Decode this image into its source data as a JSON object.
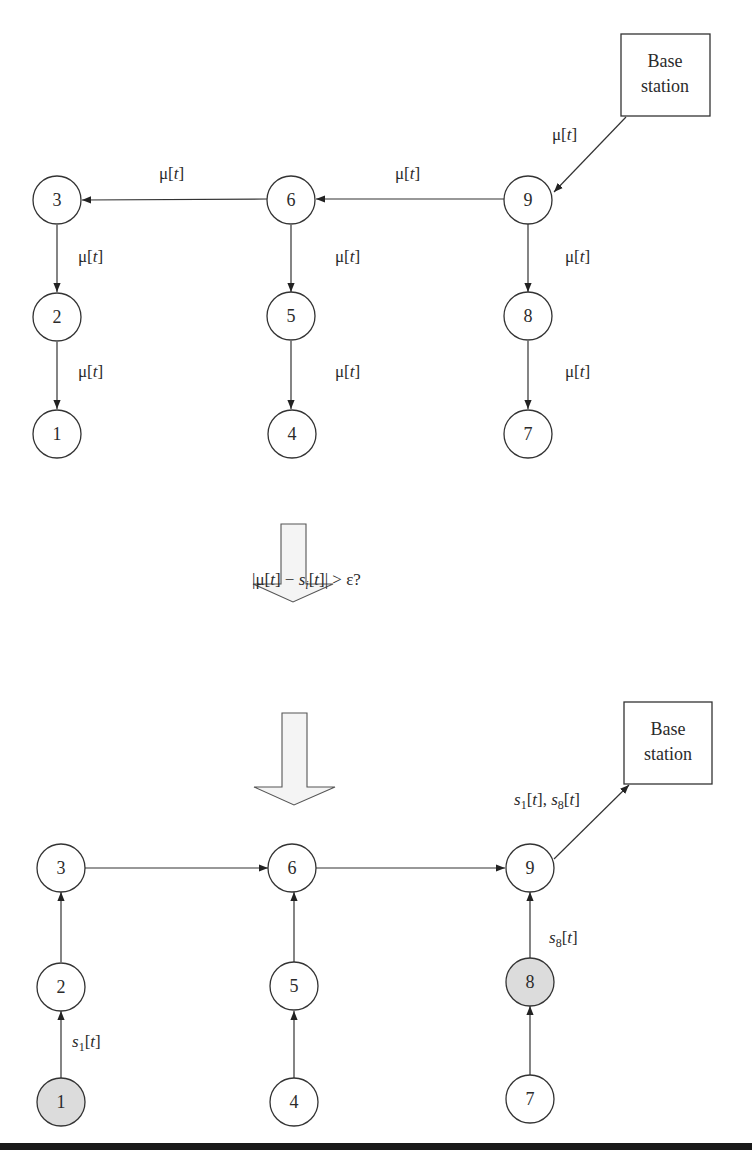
{
  "top_diagram": {
    "base_station": {
      "line1": "Base",
      "line2": "station"
    },
    "nodes": [
      {
        "id": "1",
        "label": "1",
        "highlighted": false
      },
      {
        "id": "2",
        "label": "2",
        "highlighted": false
      },
      {
        "id": "3",
        "label": "3",
        "highlighted": false
      },
      {
        "id": "4",
        "label": "4",
        "highlighted": false
      },
      {
        "id": "5",
        "label": "5",
        "highlighted": false
      },
      {
        "id": "6",
        "label": "6",
        "highlighted": false
      },
      {
        "id": "7",
        "label": "7",
        "highlighted": false
      },
      {
        "id": "8",
        "label": "8",
        "highlighted": false
      },
      {
        "id": "9",
        "label": "9",
        "highlighted": false
      }
    ],
    "edges": [
      {
        "from": "Base station",
        "to": "9",
        "label_main": "μ[",
        "label_var": "t",
        "label_end": "]"
      },
      {
        "from": "9",
        "to": "6",
        "label_main": "μ[",
        "label_var": "t",
        "label_end": "]"
      },
      {
        "from": "6",
        "to": "3",
        "label_main": "μ[",
        "label_var": "t",
        "label_end": "]"
      },
      {
        "from": "3",
        "to": "2",
        "label_main": "μ[",
        "label_var": "t",
        "label_end": "]"
      },
      {
        "from": "2",
        "to": "1",
        "label_main": "μ[",
        "label_var": "t",
        "label_end": "]"
      },
      {
        "from": "6",
        "to": "5",
        "label_main": "μ[",
        "label_var": "t",
        "label_end": "]"
      },
      {
        "from": "5",
        "to": "4",
        "label_main": "μ[",
        "label_var": "t",
        "label_end": "]"
      },
      {
        "from": "9",
        "to": "8",
        "label_main": "μ[",
        "label_var": "t",
        "label_end": "]"
      },
      {
        "from": "8",
        "to": "7",
        "label_main": "μ[",
        "label_var": "t",
        "label_end": "]"
      }
    ]
  },
  "condition": {
    "p1": "|μ[",
    "t1": "t",
    "p2": "] − ",
    "s": "s",
    "sub_i": "i",
    "p3": "[",
    "t2": "t",
    "p4": "]| > ε?"
  },
  "bottom_diagram": {
    "base_station": {
      "line1": "Base",
      "line2": "station"
    },
    "nodes": [
      {
        "id": "1",
        "label": "1",
        "highlighted": true
      },
      {
        "id": "2",
        "label": "2",
        "highlighted": false
      },
      {
        "id": "3",
        "label": "3",
        "highlighted": false
      },
      {
        "id": "4",
        "label": "4",
        "highlighted": false
      },
      {
        "id": "5",
        "label": "5",
        "highlighted": false
      },
      {
        "id": "6",
        "label": "6",
        "highlighted": false
      },
      {
        "id": "7",
        "label": "7",
        "highlighted": false
      },
      {
        "id": "8",
        "label": "8",
        "highlighted": true
      },
      {
        "id": "9",
        "label": "9",
        "highlighted": false
      }
    ],
    "edges": [
      {
        "from": "1",
        "to": "2",
        "label": "s1[t]",
        "s": "s",
        "sub": "1",
        "t": "t"
      },
      {
        "from": "2",
        "to": "3",
        "label": ""
      },
      {
        "from": "3",
        "to": "6",
        "label": ""
      },
      {
        "from": "4",
        "to": "5",
        "label": ""
      },
      {
        "from": "5",
        "to": "6",
        "label": ""
      },
      {
        "from": "6",
        "to": "9",
        "label": ""
      },
      {
        "from": "7",
        "to": "8",
        "label": ""
      },
      {
        "from": "8",
        "to": "9",
        "label": "s8[t]",
        "s": "s",
        "sub": "8",
        "t": "t"
      },
      {
        "from": "9",
        "to": "Base station",
        "label": "s1[t], s8[t]",
        "s_a": "s",
        "sub_a": "1",
        "t_a": "t",
        "sep": ", ",
        "s_b": "s",
        "sub_b": "8",
        "t_b": "t"
      }
    ]
  },
  "colors": {
    "stroke": "#333333",
    "highlight_fill": "#dcdcdc",
    "arrow_fill": "#f4f4f4",
    "rule": "#1a1a1a"
  }
}
